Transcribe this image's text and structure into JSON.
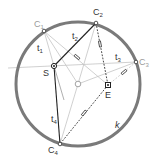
{
  "diagram": {
    "circle": {
      "cx": 78,
      "cy": 84,
      "r": 62,
      "color": "#7a7a7a",
      "label": "k"
    },
    "points": {
      "C1": {
        "x": 44,
        "y": 31,
        "label": "C",
        "sub": "1"
      },
      "C2": {
        "x": 96,
        "y": 23,
        "label": "C",
        "sub": "2"
      },
      "C3": {
        "x": 136,
        "y": 62,
        "label": "C",
        "sub": "3"
      },
      "C4": {
        "x": 60,
        "y": 144,
        "label": "C",
        "sub": "4"
      },
      "S": {
        "x": 54,
        "y": 66,
        "label": "S"
      },
      "E": {
        "x": 108,
        "y": 85,
        "label": "E"
      },
      "O": {
        "x": 78,
        "y": 84,
        "label": ""
      }
    },
    "tangent_labels": {
      "t1": {
        "label": "t",
        "sub": "1"
      },
      "t2": {
        "label": "t",
        "sub": "2"
      },
      "t3": {
        "label": "t",
        "sub": "3"
      },
      "t4": {
        "label": "t",
        "sub": "4"
      }
    },
    "colors": {
      "dark_line": "#222222",
      "light_line": "#bdbdbd",
      "label_dark": "#333333",
      "label_light": "#9a9a9a"
    }
  }
}
